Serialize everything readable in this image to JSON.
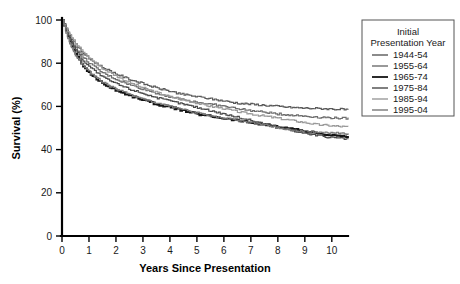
{
  "chart_data": {
    "type": "line",
    "title": "",
    "xlabel": "Years Since Presentation",
    "ylabel": "Survival (%)",
    "xlim": [
      0,
      10.6
    ],
    "ylim": [
      0,
      100
    ],
    "xticks": [
      "0",
      "1",
      "2",
      "3",
      "4",
      "5",
      "6",
      "7",
      "8",
      "9",
      "10"
    ],
    "yticks": [
      "0",
      "20",
      "40",
      "60",
      "80",
      "100"
    ],
    "grid": false,
    "legend_position": "right-top",
    "legend_title_line1": "Initial",
    "legend_title_line2": "Presentation Year",
    "x": [
      0,
      0.25,
      0.5,
      0.75,
      1,
      1.5,
      2,
      2.5,
      3,
      3.5,
      4,
      4.5,
      5,
      5.5,
      6,
      6.5,
      7,
      7.5,
      8,
      8.5,
      9,
      9.5,
      10,
      10.5
    ],
    "series": [
      {
        "name": "1944-54",
        "color": "#5a5a5a",
        "width": 1.2,
        "values": [
          100,
          93.5,
          88.5,
          85.0,
          82.0,
          78.0,
          75.0,
          72.5,
          70.5,
          68.5,
          67.0,
          65.5,
          64.5,
          63.5,
          62.5,
          61.5,
          61.0,
          60.5,
          60.0,
          59.5,
          59.2,
          59.0,
          58.8,
          58.5
        ]
      },
      {
        "name": "1955-64",
        "color": "#6e6e6e",
        "width": 1.2,
        "values": [
          100,
          92.5,
          87.0,
          83.0,
          80.0,
          75.5,
          72.5,
          70.0,
          68.0,
          66.0,
          64.5,
          63.0,
          62.0,
          61.0,
          60.0,
          59.0,
          58.0,
          57.3,
          56.5,
          56.0,
          55.5,
          55.0,
          54.7,
          54.5
        ]
      },
      {
        "name": "1965-74",
        "color": "#141414",
        "width": 1.8,
        "values": [
          100,
          91.0,
          84.0,
          79.0,
          75.5,
          70.5,
          67.5,
          65.0,
          63.0,
          61.0,
          59.5,
          58.0,
          56.5,
          55.5,
          54.5,
          53.5,
          52.5,
          51.5,
          50.5,
          49.5,
          48.5,
          47.5,
          46.5,
          46.0
        ]
      },
      {
        "name": "1975-84",
        "color": "#4a4a4a",
        "width": 1.2,
        "values": [
          100,
          92.0,
          86.0,
          81.5,
          78.5,
          73.5,
          70.5,
          68.0,
          66.0,
          64.0,
          62.5,
          61.0,
          59.5,
          58.0,
          56.5,
          55.0,
          53.5,
          52.0,
          50.5,
          49.0,
          47.5,
          46.5,
          45.5,
          45.0
        ]
      },
      {
        "name": "1985-94",
        "color": "#9a9a9a",
        "width": 1.2,
        "values": [
          100,
          94.0,
          89.0,
          85.5,
          82.5,
          77.5,
          74.0,
          71.0,
          68.5,
          66.5,
          64.5,
          63.0,
          61.5,
          60.0,
          59.0,
          57.5,
          56.5,
          55.5,
          54.5,
          53.5,
          52.5,
          51.5,
          51.0,
          50.5
        ]
      },
      {
        "name": "1995-04",
        "color": "#787878",
        "width": 1.2,
        "values": [
          100,
          90.0,
          83.5,
          79.5,
          76.0,
          71.0,
          68.0,
          65.5,
          63.5,
          61.5,
          60.0,
          58.5,
          57.0,
          55.5,
          54.5,
          53.5,
          52.5,
          51.5,
          50.0,
          49.0,
          48.5,
          48.0,
          47.8,
          47.5
        ]
      }
    ]
  }
}
